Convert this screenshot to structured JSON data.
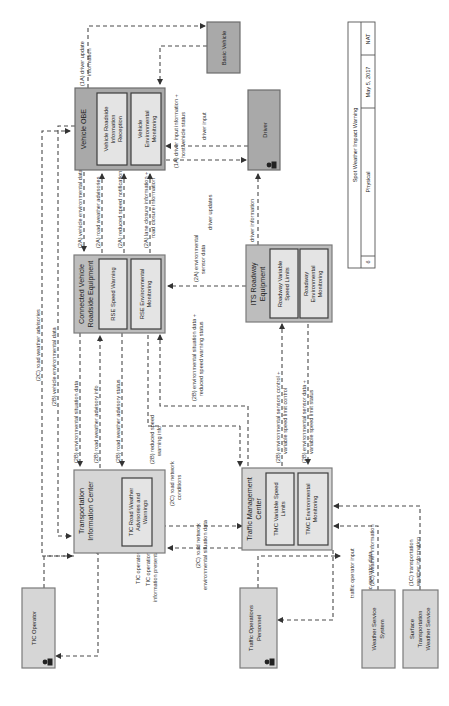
{
  "diagram": {
    "title_block": {
      "title": "Spot Weather Impact Warning",
      "sheet": "6",
      "view": "Physical",
      "date": "May 5, 2017",
      "author": "NAT"
    },
    "entities": {
      "vehicle_obe": {
        "title": "Vehicle OBE",
        "subsystems": [
          "Vehicle Roadside Information Reception",
          "Vehicle Environmental Monitoring"
        ]
      },
      "basic_vehicle": {
        "title": "Basic Vehicle"
      },
      "driver": {
        "title": "Driver"
      },
      "cv_rse": {
        "title_line1": "Connected Vehicle",
        "title_line2": "Roadside Equipment",
        "subsystems": [
          "RSE Speed Warning",
          "RSE Environmental Monitoring"
        ]
      },
      "its_roadway": {
        "title_line1": "ITS Roadway",
        "title_line2": "Equipment",
        "subsystems": [
          "Roadway Variable Speed Limits",
          "Roadway Environmental Monitoring"
        ]
      },
      "tic": {
        "title_line1": "Transportation",
        "title_line2": "Information Center",
        "subsystems": [
          "TIC Road Weather Advisories and Warnings"
        ]
      },
      "tmc": {
        "title_line1": "Traffic Management",
        "title_line2": "Center",
        "subsystems": [
          "TMC Variable Speed Limits",
          "TMC Environmental Monitoring"
        ]
      },
      "tic_operator": {
        "title": "TIC Operator"
      },
      "traffic_ops_personnel": {
        "title_line1": "Traffic Operations",
        "title_line2": "Personnel"
      },
      "weather_service_system": {
        "title_line1": "Weather Service",
        "title_line2": "System"
      },
      "stws": {
        "title_line1": "Surface",
        "title_line2": "Transportation",
        "title_line3": "Weather Service"
      }
    },
    "flows": {
      "f1a_driver_update": [
        "(1A) driver update",
        "information"
      ],
      "f1a_driver_input_host": [
        "(1A) driver input information +",
        "host vehicle status"
      ],
      "driver_input": "driver input",
      "driver_updates": "driver updates",
      "driver_information": "driver information",
      "f2a_vehicle_env_data": "(2A) vehicle environmental data",
      "f2a_road_weather_adv": "(2A) road weather advisories",
      "f2a_reduced_speed_notif": "(2A) reduced speed notification",
      "f2a_lane_closure": [
        "(2A) lane closure information +",
        "road closure information"
      ],
      "f2a_env_sensor_data": [
        "(2A) environmental",
        "sensor data"
      ],
      "f2c_road_weather_adv": "(2C) road weather advisories",
      "f2b_vehicle_env_data": "(2B) vehicle environmental data",
      "f2b_env_situation_data": "(2B) environmental situation data",
      "f2b_road_weather_adv_info": "(2B) road weather advisory info",
      "f2b_road_weather_adv_status": "(2B) road weather advisory status",
      "f2b_env_situation_reduced": [
        "(2B) environmental situation data +",
        "reduced speed warning status"
      ],
      "f2b_env_sensors_control": [
        "(2B) environmental sensors control +",
        "variable speed limit control"
      ],
      "f2b_env_sensor_data_vsl": [
        "(2B) environmental sensor data +",
        "variable speed limit status"
      ],
      "f2b_reduced_speed_warning": [
        "(2B) reduced speed",
        "warning info"
      ],
      "f2c_road_network_conditions": [
        "(2C) road network",
        "conditions"
      ],
      "f2c_road_network_env": [
        "(2C) road network",
        "environmental situation data"
      ],
      "tic_operator_input": "TIC operator input",
      "tic_operations_info": [
        "TIC operations",
        "information presentation"
      ],
      "traffic_operator_input": "traffic operator input",
      "traffic_operator_data": "traffic operator data",
      "f2c_weather_information": "(2C) weather information",
      "f1c_transportation_weather": [
        "(1C) transportation",
        "weather information"
      ]
    }
  }
}
